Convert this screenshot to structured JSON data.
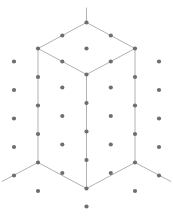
{
  "figure": {
    "type": "vector-diagram",
    "width": 173,
    "height": 216,
    "background_color": "#ffffff"
  },
  "style": {
    "edge_color": "#a8a8a8",
    "edge_width": 0.9,
    "dot_color": "#6e6e6e",
    "dot_radius": 2.1,
    "faint_dot_color": "#777777"
  },
  "geometry": {
    "center_x": 86.5,
    "top_apex_y": 22.5,
    "half_width": 48.5,
    "rhombus_half_height": 26.0,
    "vertical_edge_length": 114.0,
    "grid_divisions": 4
  },
  "edges": [
    {
      "name": "top-apex-stub",
      "x1": 86.5,
      "y1": 8.0,
      "x2": 86.5,
      "y2": 22.5
    },
    {
      "name": "top-face-upper-left",
      "x1": 86.5,
      "y1": 22.5,
      "x2": 38.0,
      "y2": 48.5
    },
    {
      "name": "top-face-upper-right",
      "x1": 86.5,
      "y1": 22.5,
      "x2": 135.0,
      "y2": 48.5
    },
    {
      "name": "top-face-lower-left",
      "x1": 38.0,
      "y1": 48.5,
      "x2": 86.5,
      "y2": 74.5
    },
    {
      "name": "top-face-lower-right",
      "x1": 135.0,
      "y1": 48.5,
      "x2": 86.5,
      "y2": 74.5
    },
    {
      "name": "vertical-edge-left",
      "x1": 38.0,
      "y1": 48.5,
      "x2": 38.0,
      "y2": 162.5
    },
    {
      "name": "vertical-edge-center",
      "x1": 86.5,
      "y1": 74.5,
      "x2": 86.5,
      "y2": 188.5
    },
    {
      "name": "vertical-edge-right",
      "x1": 135.0,
      "y1": 48.5,
      "x2": 135.0,
      "y2": 162.5
    },
    {
      "name": "bottom-face-left",
      "x1": 38.0,
      "y1": 162.5,
      "x2": 86.5,
      "y2": 188.5
    },
    {
      "name": "bottom-face-right",
      "x1": 135.0,
      "y1": 162.5,
      "x2": 86.5,
      "y2": 188.5
    },
    {
      "name": "bottom-left-extension",
      "x1": 38.0,
      "y1": 162.5,
      "x2": 2.0,
      "y2": 181.5
    },
    {
      "name": "bottom-right-extension",
      "x1": 135.0,
      "y1": 162.5,
      "x2": 171.0,
      "y2": 181.5
    }
  ],
  "dots": [
    {
      "name": "top-face-apex",
      "x": 86.5,
      "y": 22.5
    },
    {
      "name": "top-face-edge-ul-mid",
      "x": 62.3,
      "y": 35.5
    },
    {
      "name": "top-face-edge-ur-mid",
      "x": 110.8,
      "y": 35.5
    },
    {
      "name": "top-face-corner-left",
      "x": 38.0,
      "y": 48.5
    },
    {
      "name": "top-face-center",
      "x": 86.5,
      "y": 48.5
    },
    {
      "name": "top-face-corner-right",
      "x": 135.0,
      "y": 48.5
    },
    {
      "name": "top-face-edge-ll-mid",
      "x": 62.3,
      "y": 61.5
    },
    {
      "name": "top-face-edge-lr-mid",
      "x": 110.8,
      "y": 61.5
    },
    {
      "name": "front-vertex-top",
      "x": 86.5,
      "y": 74.5
    },
    {
      "name": "left-edge-row1",
      "x": 38.0,
      "y": 48.5
    },
    {
      "name": "left-edge-row2",
      "x": 38.0,
      "y": 77.0
    },
    {
      "name": "left-edge-row3",
      "x": 38.0,
      "y": 105.5
    },
    {
      "name": "left-edge-row4",
      "x": 38.0,
      "y": 134.0
    },
    {
      "name": "left-edge-row5",
      "x": 38.0,
      "y": 162.5
    },
    {
      "name": "right-edge-row1",
      "x": 135.0,
      "y": 48.5
    },
    {
      "name": "right-edge-row2",
      "x": 135.0,
      "y": 77.0
    },
    {
      "name": "right-edge-row3",
      "x": 135.0,
      "y": 105.5
    },
    {
      "name": "right-edge-row4",
      "x": 135.0,
      "y": 134.0
    },
    {
      "name": "right-edge-row5",
      "x": 135.0,
      "y": 162.5
    },
    {
      "name": "center-edge-row1",
      "x": 86.5,
      "y": 74.5
    },
    {
      "name": "center-edge-row2",
      "x": 86.5,
      "y": 103.0
    },
    {
      "name": "center-edge-row3",
      "x": 86.5,
      "y": 131.5
    },
    {
      "name": "center-edge-row4",
      "x": 86.5,
      "y": 160.0
    },
    {
      "name": "center-edge-row5",
      "x": 86.5,
      "y": 188.5
    },
    {
      "name": "left-face-center-row1",
      "x": 62.3,
      "y": 87.5
    },
    {
      "name": "left-face-center-row2",
      "x": 62.3,
      "y": 116.0
    },
    {
      "name": "left-face-center-row3",
      "x": 62.3,
      "y": 144.5
    },
    {
      "name": "left-face-center-row4",
      "x": 62.3,
      "y": 173.0
    },
    {
      "name": "right-face-center-row1",
      "x": 110.8,
      "y": 87.5
    },
    {
      "name": "right-face-center-row2",
      "x": 110.8,
      "y": 116.0
    },
    {
      "name": "right-face-center-row3",
      "x": 110.8,
      "y": 144.5
    },
    {
      "name": "right-face-center-row4",
      "x": 110.8,
      "y": 173.0
    },
    {
      "name": "outer-left-col-row1",
      "x": 14.0,
      "y": 61.5
    },
    {
      "name": "outer-left-col-row2",
      "x": 14.0,
      "y": 90.0
    },
    {
      "name": "outer-left-col-row3",
      "x": 14.0,
      "y": 118.5
    },
    {
      "name": "outer-left-col-row4",
      "x": 14.0,
      "y": 147.0
    },
    {
      "name": "outer-left-col-row5",
      "x": 14.0,
      "y": 175.5
    },
    {
      "name": "outer-right-col-row1",
      "x": 159.0,
      "y": 61.5
    },
    {
      "name": "outer-right-col-row2",
      "x": 159.0,
      "y": 90.0
    },
    {
      "name": "outer-right-col-row3",
      "x": 159.0,
      "y": 118.5
    },
    {
      "name": "outer-right-col-row4",
      "x": 159.0,
      "y": 147.0
    },
    {
      "name": "outer-right-col-row5",
      "x": 159.0,
      "y": 175.5
    },
    {
      "name": "below-left-lower",
      "x": 38.0,
      "y": 191.0
    },
    {
      "name": "below-right-lower",
      "x": 135.0,
      "y": 191.0
    },
    {
      "name": "below-center-lowest",
      "x": 86.5,
      "y": 206.5
    }
  ]
}
